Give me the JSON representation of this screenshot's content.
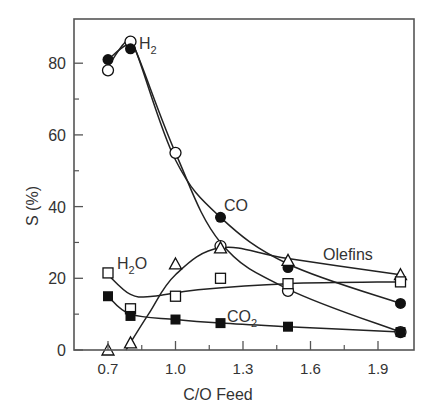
{
  "chart_data": {
    "type": "line",
    "title": "",
    "xlabel": "C/O Feed",
    "ylabel": "S (%)",
    "xlim": [
      0.55,
      2.05
    ],
    "ylim": [
      0,
      90
    ],
    "x_ticks": [
      "0.7",
      "1.0",
      "1.3",
      "1.6",
      "1.9"
    ],
    "x_tick_values": [
      0.7,
      1.0,
      1.3,
      1.6,
      1.9
    ],
    "x_minor_ticks": [
      0.85,
      1.15,
      1.45,
      1.75
    ],
    "y_ticks": [
      "0",
      "20",
      "40",
      "60",
      "80"
    ],
    "y_tick_values": [
      0,
      20,
      40,
      60,
      80
    ],
    "y_minor_ticks": [
      10,
      30,
      50,
      70
    ],
    "grid": false,
    "legend": "inline labels",
    "series": [
      {
        "name": "H2",
        "label_main": "H",
        "label_sub": "2",
        "marker": "open-circle",
        "x": [
          0.7,
          0.8,
          1.0,
          1.2,
          1.5,
          2.0
        ],
        "values": [
          78,
          86,
          55,
          29,
          16.5,
          5
        ]
      },
      {
        "name": "CO",
        "label_main": "CO",
        "label_sub": "",
        "marker": "filled-circle",
        "x": [
          0.7,
          0.8,
          1.2,
          1.5,
          2.0
        ],
        "values": [
          81,
          84,
          37,
          23,
          13
        ]
      },
      {
        "name": "Olefins",
        "label_main": "Olefins",
        "label_sub": "",
        "marker": "open-triangle",
        "x": [
          0.7,
          0.8,
          1.0,
          1.2,
          1.5,
          2.0
        ],
        "values": [
          0,
          2,
          24,
          28.5,
          25,
          21
        ]
      },
      {
        "name": "H2O",
        "label_main": "H",
        "label_sub": "2",
        "label_tail": "O",
        "marker": "open-square",
        "x": [
          0.7,
          0.8,
          1.0,
          1.2,
          1.5,
          2.0
        ],
        "values": [
          21.5,
          11.5,
          15,
          20,
          18.5,
          19
        ]
      },
      {
        "name": "CO2",
        "label_main": "CO",
        "label_sub": "2",
        "marker": "filled-square",
        "x": [
          0.7,
          0.8,
          1.0,
          1.2,
          1.5,
          2.0
        ],
        "values": [
          15,
          9.5,
          8.5,
          7.5,
          6.5,
          5
        ]
      }
    ],
    "colors": {
      "axis": "#555555",
      "line": "#222222",
      "marker": "#111111",
      "text": "#333333"
    }
  }
}
